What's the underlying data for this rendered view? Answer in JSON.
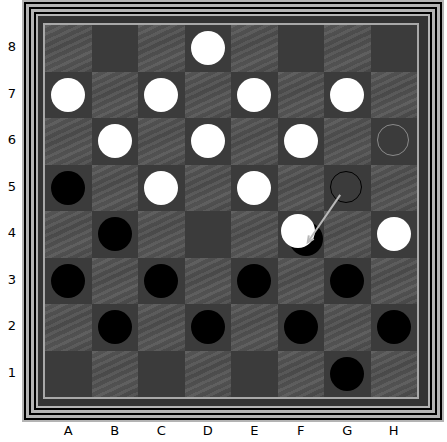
{
  "board": {
    "files": [
      "A",
      "B",
      "C",
      "D",
      "E",
      "F",
      "G",
      "H"
    ],
    "ranks": [
      "8",
      "7",
      "6",
      "5",
      "4",
      "3",
      "2",
      "1"
    ],
    "colors": {
      "light_square": "#525252",
      "dark_square": "#3b3b3b",
      "white_piece": "#ffffff",
      "black_piece": "#000000",
      "frame": "#b4b4b4",
      "arrow": "#b8b8b8"
    },
    "pieces": [
      {
        "square": "D8",
        "color": "white"
      },
      {
        "square": "A7",
        "color": "white"
      },
      {
        "square": "C7",
        "color": "white"
      },
      {
        "square": "E7",
        "color": "white"
      },
      {
        "square": "G7",
        "color": "white"
      },
      {
        "square": "B6",
        "color": "white"
      },
      {
        "square": "D6",
        "color": "white"
      },
      {
        "square": "F6",
        "color": "white"
      },
      {
        "square": "A5",
        "color": "black"
      },
      {
        "square": "C5",
        "color": "white"
      },
      {
        "square": "E5",
        "color": "white"
      },
      {
        "square": "B4",
        "color": "black"
      },
      {
        "square": "F4",
        "color": "black",
        "stacked": "under"
      },
      {
        "square": "F4",
        "color": "white",
        "stacked": "over"
      },
      {
        "square": "H4",
        "color": "white"
      },
      {
        "square": "A3",
        "color": "black"
      },
      {
        "square": "C3",
        "color": "black"
      },
      {
        "square": "E3",
        "color": "black"
      },
      {
        "square": "G3",
        "color": "black"
      },
      {
        "square": "B2",
        "color": "black"
      },
      {
        "square": "D2",
        "color": "black"
      },
      {
        "square": "F2",
        "color": "black"
      },
      {
        "square": "H2",
        "color": "black"
      },
      {
        "square": "G1",
        "color": "black"
      }
    ],
    "highlights": [
      {
        "square": "H6",
        "style": "grey-ring"
      },
      {
        "square": "G5",
        "style": "black-ring"
      }
    ],
    "move_arrow": {
      "from": "G5",
      "to": "F4"
    }
  }
}
